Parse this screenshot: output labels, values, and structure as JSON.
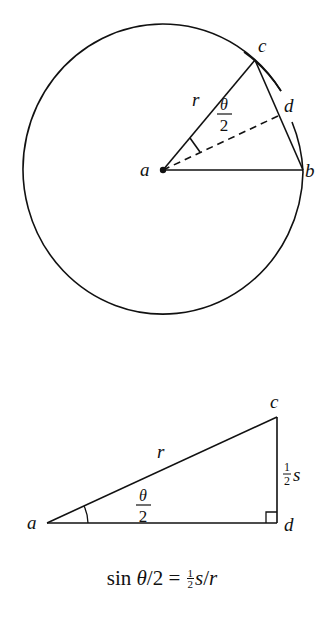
{
  "figure_top": {
    "circle": {
      "cx": 163,
      "cy": 169,
      "rx": 140,
      "ry": 145
    },
    "points": {
      "a": {
        "x": 163,
        "y": 170,
        "label": "a"
      },
      "b": {
        "x": 303,
        "y": 170,
        "label": "b"
      },
      "c": {
        "x": 255,
        "y": 60,
        "label": "c"
      },
      "d": {
        "x": 278,
        "y": 116,
        "label": "d"
      }
    },
    "labels": {
      "radius": "r",
      "angle_num": "θ",
      "angle_den": "2"
    }
  },
  "figure_bottom": {
    "points": {
      "a": {
        "x": 47,
        "y": 523,
        "label": "a"
      },
      "c": {
        "x": 277,
        "y": 417,
        "label": "c"
      },
      "d": {
        "x": 277,
        "y": 523,
        "label": "d"
      }
    },
    "labels": {
      "hypotenuse": "r",
      "angle_num": "θ",
      "angle_den": "2",
      "opposite_num": "1",
      "opposite_den": "2",
      "opposite_var": "s"
    }
  },
  "formula": {
    "lhs_func": "sin ",
    "lhs_var": "θ",
    "lhs_rest": "/2 = ",
    "frac_num": "1",
    "frac_den": "2",
    "rhs_var1": "s",
    "rhs_slash": "/",
    "rhs_var2": "r"
  },
  "colors": {
    "ink": "#111111",
    "background": "#ffffff"
  }
}
